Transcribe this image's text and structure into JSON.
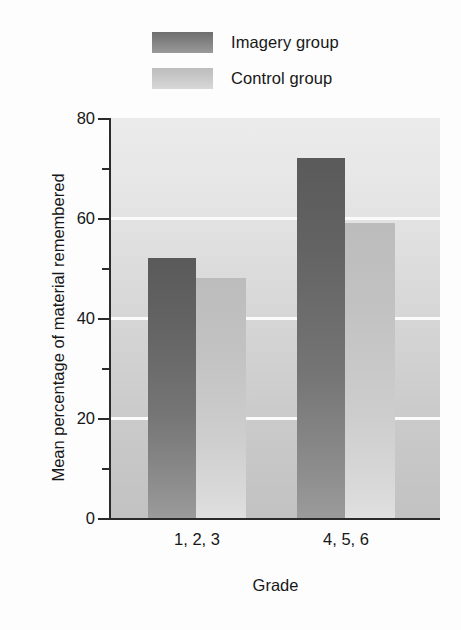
{
  "chart_data": {
    "type": "bar",
    "title": "",
    "xlabel": "Grade",
    "ylabel": "Mean percentage of material remembered",
    "categories": [
      "1, 2, 3",
      "4, 5, 6"
    ],
    "series": [
      {
        "name": "Imagery group",
        "values": [
          52,
          72
        ],
        "color": "#6e6e6e"
      },
      {
        "name": "Control group",
        "values": [
          48,
          59
        ],
        "color": "#c7c7c7"
      }
    ],
    "ylim": [
      0,
      80
    ],
    "ytick_labels": [
      "0",
      "20",
      "40",
      "60",
      "80"
    ],
    "ytick_values": [
      0,
      20,
      40,
      60,
      80
    ],
    "yminor_values": [
      10,
      30,
      50,
      70
    ],
    "gridlines": [
      20,
      40,
      60
    ],
    "grid": true,
    "legend_position": "top-center",
    "plot_background": "#dcdcdc",
    "gridline_color": "#fbfbfb",
    "axis_color": "#2b2b2b"
  },
  "legend": {
    "items": [
      {
        "label": "Imagery group",
        "swatch": "dark-gray-swatch"
      },
      {
        "label": "Control group",
        "swatch": "light-gray-swatch"
      }
    ]
  },
  "axes": {
    "y_title": "Mean percentage of material remembered",
    "x_title": "Grade",
    "y_ticks": [
      {
        "value": 80,
        "label": "80",
        "major": true
      },
      {
        "value": 70,
        "label": "",
        "major": false
      },
      {
        "value": 60,
        "label": "60",
        "major": true
      },
      {
        "value": 50,
        "label": "",
        "major": false
      },
      {
        "value": 40,
        "label": "40",
        "major": true
      },
      {
        "value": 30,
        "label": "",
        "major": false
      },
      {
        "value": 20,
        "label": "20",
        "major": true
      },
      {
        "value": 10,
        "label": "",
        "major": false
      },
      {
        "value": 0,
        "label": "0",
        "major": true
      }
    ],
    "x_ticks": [
      {
        "label": "1, 2, 3"
      },
      {
        "label": "4, 5, 6"
      }
    ]
  },
  "bars": [
    {
      "group": "1, 2, 3",
      "series": "Imagery group",
      "value": 52,
      "style": "bar-dark",
      "left": 37,
      "width": 48
    },
    {
      "group": "1, 2, 3",
      "series": "Control group",
      "value": 48,
      "style": "bar-light",
      "left": 85,
      "width": 50
    },
    {
      "group": "4, 5, 6",
      "series": "Imagery group",
      "value": 72,
      "style": "bar-dark",
      "left": 186,
      "width": 48
    },
    {
      "group": "4, 5, 6",
      "series": "Control group",
      "value": 59,
      "style": "bar-light",
      "left": 234,
      "width": 50
    }
  ]
}
